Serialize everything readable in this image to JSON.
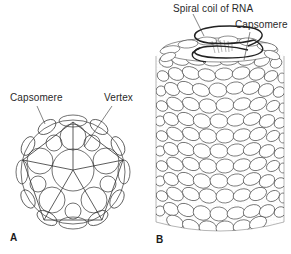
{
  "figure": {
    "panel_a": {
      "letter": "A",
      "title": "Icosahedral capsid",
      "labels": {
        "capsomere": "Capsomere",
        "vertex": "Vertex"
      }
    },
    "panel_b": {
      "letter": "B",
      "title": "Helical capsid",
      "labels": {
        "rna": "Spiral coil of RNA",
        "capsomere": "Capsomere"
      }
    }
  },
  "colors": {
    "line": "#333333",
    "stipple": "#9a9a9a",
    "background": "#ffffff"
  }
}
